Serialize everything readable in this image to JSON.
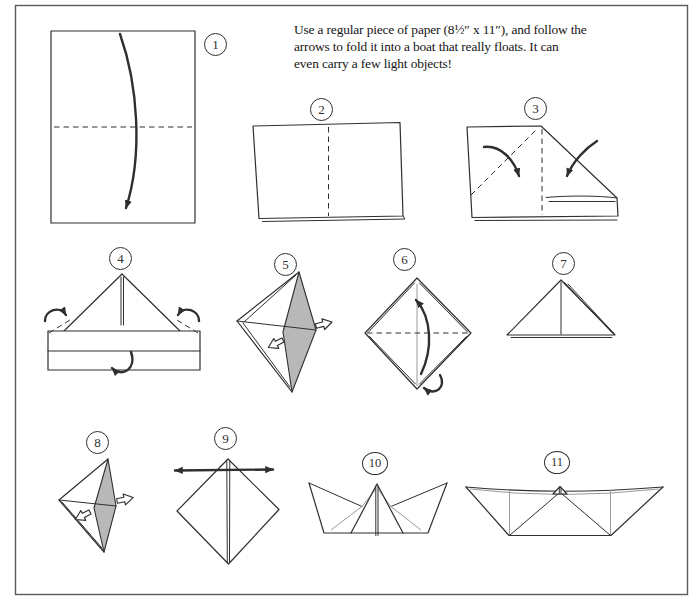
{
  "instructions": {
    "lines": [
      "Use a regular piece of paper (8½″ x 11″), and follow the",
      "arrows to fold it into a boat that really floats. It can",
      "even carry a few light objects!"
    ]
  },
  "steps": [
    {
      "number": "1"
    },
    {
      "number": "2"
    },
    {
      "number": "3"
    },
    {
      "number": "4"
    },
    {
      "number": "5"
    },
    {
      "number": "6"
    },
    {
      "number": "7"
    },
    {
      "number": "8"
    },
    {
      "number": "9"
    },
    {
      "number": "10"
    },
    {
      "number": "11"
    }
  ],
  "icons": {
    "fold_arrow": "curved-solid-arrow",
    "turn_over_arrow": "curl-arrow",
    "pull_apart_arrow": "hollow-outline-arrow",
    "stretch_arrow": "double-headed-arrow",
    "fold_line": "dashed-line"
  },
  "colors": {
    "line": "#2f2f2f",
    "hidden_line": "#9a9a9a",
    "shade": "#b8b8b8",
    "background": "#ffffff",
    "frame_border": "#5a5a5a"
  }
}
